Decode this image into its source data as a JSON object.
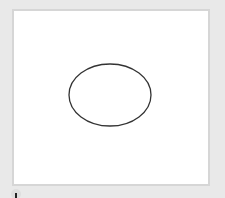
{
  "canvas": {
    "background": "#ffffff",
    "frame_color": "#d6d6d6",
    "shapes": [
      {
        "type": "ellipse",
        "cx": 96,
        "cy": 84,
        "rx": 41,
        "ry": 31,
        "stroke": "#333333",
        "stroke_width": 1.3,
        "fill": "none"
      }
    ]
  },
  "toolbar": {
    "icons": [
      {
        "name": "drawing-tool-icon"
      }
    ]
  },
  "colors": {
    "page_background": "#e9e9e9"
  }
}
